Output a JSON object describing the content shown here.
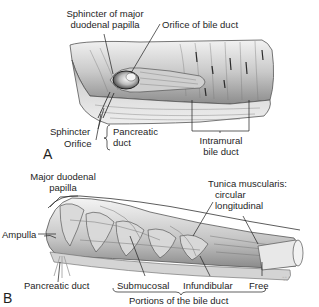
{
  "figure": {
    "panel_a": {
      "letter": "A",
      "labels": {
        "sphincter_major_papilla_1": "Sphincter of major",
        "sphincter_major_papilla_2": "duodenal papilla",
        "orifice_bile_duct": "Orifice of bile duct",
        "sphincter": "Sphincter",
        "orifice": "Orifice",
        "pancreatic_duct_1": "Pancreatic",
        "pancreatic_duct_2": "duct",
        "intramural_1": "Intramural",
        "intramural_2": "bile duct"
      }
    },
    "panel_b": {
      "letter": "B",
      "labels": {
        "major_papilla_1": "Major duodenal",
        "major_papilla_2": "papilla",
        "tunica_1": "Tunica muscularis:",
        "tunica_2": "circular",
        "tunica_3": "longitudinal",
        "ampulla": "Ampulla",
        "pancreatic_duct": "Pancreatic duct",
        "submucosal": "Submucosal",
        "infundibular": "Infundibular",
        "free": "Free",
        "portions": "Portions of the bile duct"
      },
      "signature": "artist signature"
    },
    "colors": {
      "background": "#ffffff",
      "ink": "#1e1e1e",
      "tissue_light": "#e6e6e6",
      "tissue_mid": "#b8b8b8",
      "tissue_dark": "#6e6e6e"
    }
  }
}
